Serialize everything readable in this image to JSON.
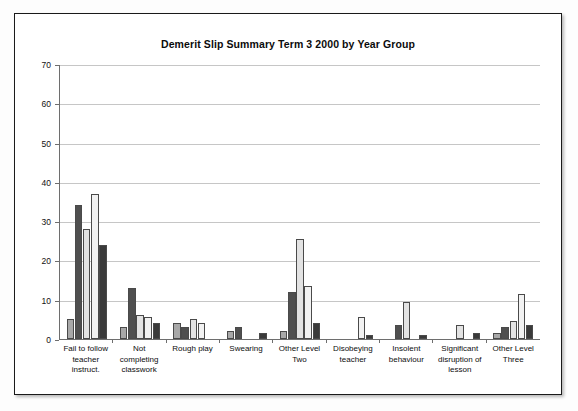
{
  "chart_data": {
    "type": "bar",
    "title": "Demerit Slip Summary Term 3 2000  by Year Group",
    "subtitle": "",
    "xlabel": "",
    "ylabel": "",
    "ylim": [
      0,
      70
    ],
    "ytick_step": 10,
    "yticks": [
      70,
      60,
      50,
      40,
      30,
      20,
      10,
      0
    ],
    "grid": true,
    "legend_position": "none",
    "categories": [
      "Fail to follow teacher instruct.",
      "Not completing classwork",
      "Rough play",
      "Swearing",
      "Other Level Two",
      "Disobeying teacher",
      "Insolent behaviour",
      "Significant disruption of lesson",
      "Other Level Three"
    ],
    "category_lines": [
      [
        "Fail to follow",
        "teacher",
        "instruct."
      ],
      [
        "Not completing",
        "classwork"
      ],
      [
        "Rough play"
      ],
      [
        "Swearing"
      ],
      [
        "Other Level",
        "Two"
      ],
      [
        "Disobeying",
        "teacher"
      ],
      [
        "Insolent",
        "behaviour"
      ],
      [
        "Significant",
        "disruption of",
        "lesson"
      ],
      [
        "Other Level",
        "Three"
      ]
    ],
    "series": [
      {
        "name": "Series 1",
        "color": "#a8a8a8",
        "values": [
          5,
          3,
          4,
          2,
          2,
          0,
          0,
          0,
          1.5
        ]
      },
      {
        "name": "Series 2",
        "color": "#4f4f4f",
        "values": [
          34,
          13,
          3,
          3,
          12,
          0,
          3.5,
          0,
          3
        ]
      },
      {
        "name": "Series 3",
        "color": "#e3e3e3",
        "values": [
          28,
          6,
          5,
          0,
          25.5,
          0,
          9.5,
          3.5,
          4.5
        ]
      },
      {
        "name": "Series 4",
        "color": "#f2f2f2",
        "values": [
          37,
          5.5,
          4,
          0,
          13.5,
          5.5,
          0,
          0,
          11.5
        ]
      },
      {
        "name": "Series 5",
        "color": "#3a3a3a",
        "values": [
          24,
          4,
          0,
          1.5,
          4,
          1,
          1,
          1.5,
          3.5
        ]
      }
    ]
  }
}
